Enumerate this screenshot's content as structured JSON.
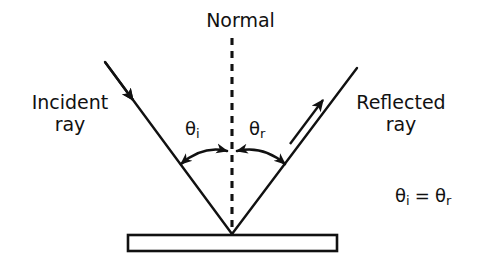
{
  "diagram": {
    "background_color": "#ffffff",
    "stroke_color": "#111111",
    "labels": {
      "normal": "Normal",
      "incident_ray_line1": "Incident",
      "incident_ray_line2": "ray",
      "reflected_ray_line1": "Reflected",
      "reflected_ray_line2": "ray",
      "angle_incidence_symbol": "θ",
      "angle_incidence_subscript": "i",
      "angle_reflection_symbol": "θ",
      "angle_reflection_subscript": "r",
      "equation_left_symbol": "θ",
      "equation_left_subscript": "i",
      "equation_operator": "=",
      "equation_right_symbol": "θ",
      "equation_right_subscript": "r",
      "equation_full": "θi = θr"
    },
    "geometry": {
      "vertex": [
        232,
        234
      ],
      "normal_line": {
        "x": 232,
        "y_top": 38,
        "y_bottom": 236,
        "style": "dashed"
      },
      "incident_ray": {
        "x1": 105,
        "y1": 62,
        "x2": 232,
        "y2": 234,
        "arrow_at": [
          130,
          95
        ]
      },
      "reflected_ray": {
        "x1": 232,
        "y1": 234,
        "x2": 357,
        "y2": 68,
        "arrow_at": [
          320,
          102
        ]
      },
      "mirror": {
        "x": 128,
        "y": 235,
        "width": 209,
        "height": 16,
        "fill": "#ffffff"
      },
      "arc_incidence": {
        "from": [
          180,
          163
        ],
        "to": [
          227,
          151
        ],
        "double_headed": true
      },
      "arc_reflection": {
        "from": [
          237,
          151
        ],
        "to": [
          285,
          163
        ],
        "double_headed": true
      }
    }
  }
}
